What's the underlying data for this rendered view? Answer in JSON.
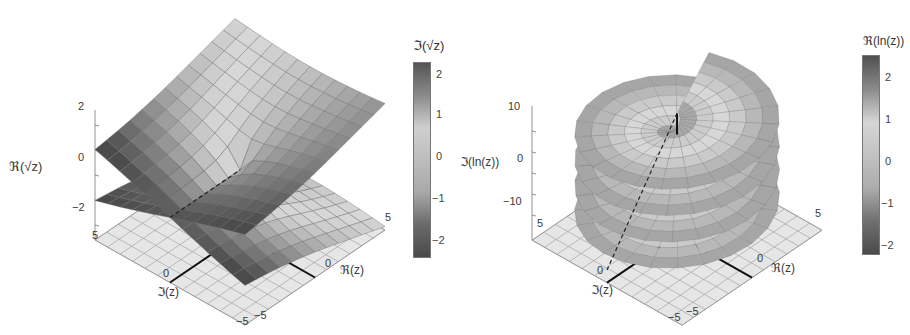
{
  "chart_data": [
    {
      "type": "surface3d",
      "title": "",
      "function": "sqrt(z)",
      "xlabel": "ℜ(z)",
      "ylabel": "ℑ(z)",
      "zlabel": "ℜ(√z)",
      "x_ticks": [
        "-5",
        "0",
        "5"
      ],
      "y_ticks": [
        "-5",
        "0",
        "5"
      ],
      "z_ticks": [
        "-2",
        "0",
        "2"
      ],
      "xlim": [
        -5,
        5
      ],
      "ylim": [
        -5,
        5
      ],
      "zlim": [
        -2.3,
        2.3
      ],
      "color_function": "ℑ(√z)",
      "colorbar": {
        "title": "ℑ(√z)",
        "ticks": [
          "2",
          "1",
          "0",
          "-1",
          "-2"
        ],
        "range": [
          -2.3,
          2.3
        ],
        "colors": [
          "#555555",
          "#8a8a8a",
          "#cfcfcf",
          "#bdbdbd",
          "#a8a8a8",
          "#6a6a6a",
          "#4a4a4a"
        ]
      },
      "notes": "Two sheets of the Riemann surface of sqrt(z), branch cut along negative real axis shown dashed; base plane grid with heavy axis lines at 0"
    },
    {
      "type": "surface3d",
      "title": "",
      "function": "ln(z)",
      "xlabel": "ℜ(z)",
      "ylabel": "ℑ(z)",
      "zlabel": "ℑ(ln(z))",
      "x_ticks": [
        "-5",
        "0",
        "5"
      ],
      "y_ticks": [
        "-5",
        "0",
        "5"
      ],
      "z_ticks": [
        "-10",
        "0",
        "10"
      ],
      "xlim": [
        -5,
        5
      ],
      "ylim": [
        -5,
        5
      ],
      "zlim": [
        -15,
        15
      ],
      "color_function": "ℜ(ln(z))",
      "colorbar": {
        "title": "ℜ(ln(z))",
        "ticks": [
          "2",
          "1",
          "0",
          "-1",
          "-2"
        ],
        "range": [
          -2.3,
          2.3
        ],
        "colors": [
          "#505050",
          "#8a8a8a",
          "#d6d6d6",
          "#c2c2c2",
          "#acacac",
          "#707070",
          "#4a4a4a"
        ]
      },
      "notes": "Helicoidal Riemann surface of ln(z) with multiple stacked turns (polar grid), branch cut dashed; base plane grid"
    }
  ],
  "left": {
    "colorbar_title": "ℑ(√z)",
    "zaxis_label": "ℜ(√z)",
    "xaxis_label": "ℜ(z)",
    "yaxis_label": "ℑ(z)",
    "z_ticks": [
      "2",
      "0",
      "−2"
    ],
    "x_ticks": {
      "near": "−5",
      "mid": "0",
      "far": "5"
    },
    "y_ticks": {
      "near": "−5",
      "mid": "0",
      "far": "5"
    },
    "cb_ticks": [
      "2",
      "1",
      "0",
      "−1",
      "−2"
    ]
  },
  "right": {
    "colorbar_title": "ℜ(ln(z))",
    "zaxis_label": "ℑ(ln(z))",
    "xaxis_label": "ℜ(z)",
    "yaxis_label": "ℑ(z)",
    "z_ticks": [
      "10",
      "0",
      "−10"
    ],
    "x_ticks": {
      "near": "−5",
      "mid": "0",
      "far": "5"
    },
    "y_ticks": {
      "near": "−5",
      "mid": "0",
      "far": "5"
    },
    "cb_ticks": [
      "2",
      "1",
      "0",
      "−1",
      "−2"
    ]
  }
}
